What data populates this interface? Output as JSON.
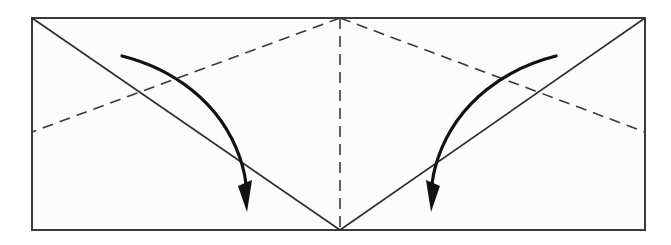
{
  "diagram": {
    "type": "origami-fold-instruction",
    "colors": {
      "paper": "#fcfcfc",
      "outline": "#3a3a3a",
      "arrow": "#111111"
    },
    "paper": {
      "x": 32,
      "y": 18,
      "width": 613,
      "height": 212
    },
    "creases": [
      {
        "id": "center-valley-line",
        "style": "dashed",
        "from": [
          340,
          18
        ],
        "to": [
          340,
          230
        ]
      },
      {
        "id": "left-valley-line",
        "style": "dashed",
        "from": [
          340,
          18
        ],
        "to": [
          32,
          132
        ]
      },
      {
        "id": "right-valley-line",
        "style": "dashed",
        "from": [
          340,
          18
        ],
        "to": [
          645,
          132
        ]
      },
      {
        "id": "left-diagonal-line",
        "style": "solid",
        "from": [
          32,
          18
        ],
        "to": [
          340,
          230
        ]
      },
      {
        "id": "right-diagonal-line",
        "style": "solid",
        "from": [
          645,
          18
        ],
        "to": [
          340,
          230
        ]
      }
    ],
    "arrows": [
      {
        "id": "left-fold-arrow",
        "direction": "down-right",
        "start": [
          122,
          56
        ],
        "end": [
          246,
          210
        ]
      },
      {
        "id": "right-fold-arrow",
        "direction": "down-left",
        "start": [
          556,
          56
        ],
        "end": [
          432,
          210
        ]
      }
    ],
    "labels": []
  }
}
